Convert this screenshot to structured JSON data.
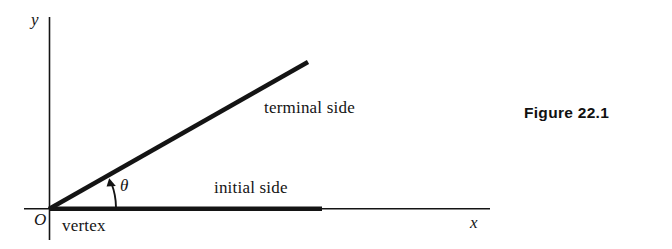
{
  "figure": {
    "caption": "Figure 22.1",
    "axes": {
      "y_label": "y",
      "x_label": "x",
      "origin_label": "O"
    },
    "labels": {
      "angle": "θ",
      "vertex": "vertex",
      "initial_side": "initial side",
      "terminal_side": "terminal side"
    },
    "colors": {
      "ink": "#141414",
      "background": "#ffffff",
      "caption": "#111111"
    },
    "geometry": {
      "origin": [
        49,
        209
      ],
      "y_axis_top": [
        49,
        17
      ],
      "x_axis_end": [
        490,
        209
      ],
      "initial_ray_end": [
        322,
        209
      ],
      "terminal_ray_end": [
        308,
        62
      ],
      "arc_arrow_tip": [
        110,
        180
      ],
      "angle_degrees": 18
    }
  }
}
